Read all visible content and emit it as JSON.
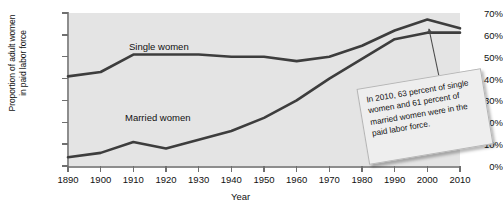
{
  "chart_data": {
    "type": "line",
    "title": "",
    "xlabel": "Year",
    "ylabel": "Proportion of adult women in paid labor force",
    "ylabel_line1": "Proportion of adult women",
    "ylabel_line2": "in paid labor force",
    "grid": false,
    "legend_position": "inline-labels",
    "xlim": [
      1890,
      2010
    ],
    "ylim": [
      0,
      70
    ],
    "x": [
      1890,
      1900,
      1910,
      1920,
      1930,
      1940,
      1950,
      1960,
      1970,
      1980,
      1990,
      2000,
      2010
    ],
    "categories": [
      "1890",
      "1900",
      "1910",
      "1920",
      "1930",
      "1940",
      "1950",
      "1960",
      "1970",
      "1980",
      "1990",
      "2000",
      "2010"
    ],
    "ytick_labels": [
      "0%",
      "10%",
      "20%",
      "30%",
      "40%",
      "50%",
      "60%",
      "70%"
    ],
    "ytick_values": [
      0,
      10,
      20,
      30,
      40,
      50,
      60,
      70
    ],
    "series": [
      {
        "name": "Single women",
        "label": "Single women",
        "color": "#3d3d3d",
        "values": [
          41,
          43,
          51,
          51,
          51,
          50,
          50,
          48,
          50,
          55,
          62,
          67,
          63
        ]
      },
      {
        "name": "Married women",
        "label": "Married women",
        "color": "#3d3d3d",
        "values": [
          4,
          6,
          11,
          8,
          12,
          16,
          22,
          30,
          40,
          49,
          58,
          61,
          61
        ]
      }
    ],
    "annotations": [
      {
        "text": "In 2010, 63 percent of single women and 61 percent of married women were in the paid labor force.",
        "points_to_x": 2010,
        "points_to_y": 63
      }
    ],
    "colors": {
      "plot_background": "#e4e4e4",
      "page_background": "#ffffff",
      "axis": "#8d8d8d",
      "line": "#3d3d3d",
      "callout_background": "#eeeeee",
      "callout_border": "#b4b4b4",
      "text": "#111111"
    }
  }
}
